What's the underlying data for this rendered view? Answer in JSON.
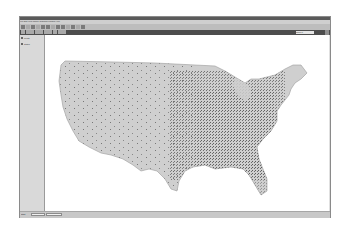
{
  "window": {
    "title": "",
    "menu_items": [
      "File",
      "Edit",
      "View",
      "Theme",
      "Graphics",
      "Window",
      "Help"
    ]
  },
  "toolbar": {
    "buttons": [
      {
        "icon": "save-icon"
      },
      {
        "icon": "add-theme-icon"
      },
      {
        "icon": "properties-icon"
      },
      {
        "icon": "legend-icon"
      },
      {
        "icon": "table-icon"
      },
      {
        "icon": "zoom-full-icon"
      },
      {
        "icon": "zoom-active-icon"
      },
      {
        "icon": "zoom-selected-icon"
      },
      {
        "icon": "zoom-in-icon"
      },
      {
        "icon": "zoom-out-icon"
      },
      {
        "icon": "select-feature-icon"
      },
      {
        "icon": "clear-selection-icon"
      },
      {
        "icon": "help-icon"
      }
    ],
    "tools": [
      {
        "icon": "identify-icon"
      },
      {
        "icon": "pointer-icon"
      },
      {
        "icon": "vertex-icon"
      },
      {
        "icon": "zoom-in-tool-icon"
      },
      {
        "icon": "zoom-out-tool-icon"
      },
      {
        "icon": "pan-icon"
      },
      {
        "icon": "measure-icon"
      },
      {
        "icon": "hotlink-icon"
      },
      {
        "icon": "text-icon"
      },
      {
        "icon": "draw-icon"
      }
    ],
    "scale_label": "Scale 1:",
    "scale_value": ""
  },
  "toc": {
    "items": [
      {
        "label": "Points",
        "checked": true
      },
      {
        "label": "States",
        "checked": true
      }
    ]
  },
  "map": {
    "land_color": "#cfcfcf",
    "outline_color": "#9a9a9a",
    "dot_color": "#555555",
    "background": "#ffffff"
  },
  "statusbar": {
    "left_label": "Start",
    "field1": "",
    "field2": "",
    "right_text": ""
  }
}
